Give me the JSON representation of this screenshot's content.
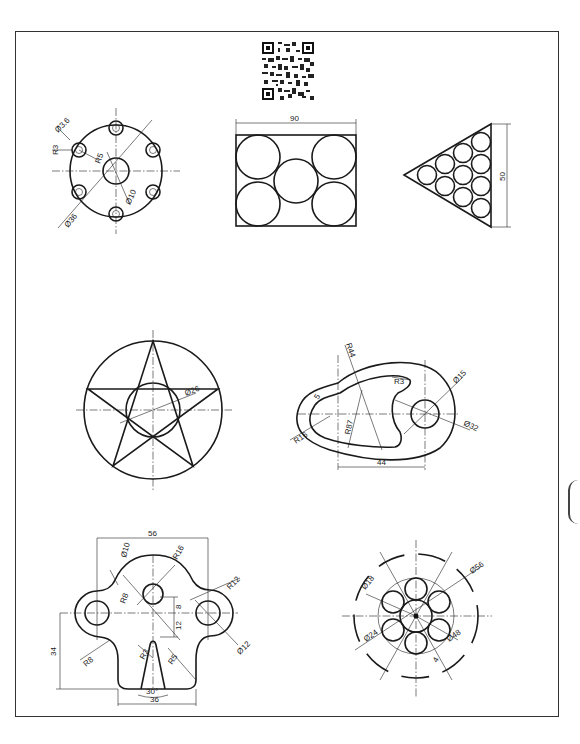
{
  "sheet": {
    "qr_code": "qr-code-icon",
    "figures": {
      "flange": {
        "labels": {
          "hole_dia": "Ø3.6",
          "boss_r": "R3",
          "pitch_r": "R5",
          "center_dia": "Ø10",
          "pcd": "Ø36"
        }
      },
      "rect_circles": {
        "labels": {
          "width": "90"
        }
      },
      "triangle_circles": {
        "labels": {
          "height": "50"
        }
      },
      "star": {
        "labels": {
          "inner_dia": "Ø26"
        }
      },
      "cam": {
        "labels": {
          "outer_r": "R44",
          "inner_r": "R87",
          "slot_r": "R3",
          "offset": "5",
          "left_r": "R16",
          "hole_dia": "Ø15",
          "boss_dia": "Ø32",
          "distance": "44"
        }
      },
      "bracket": {
        "labels": {
          "width": "56",
          "top_hole": "Ø10",
          "top_r": "R16",
          "neck_r": "R8",
          "right_r": "R12",
          "right_hole": "Ø12",
          "offset_8": "8",
          "offset_12": "12",
          "height": "34",
          "left_r": "R8",
          "slot_r": "R3",
          "slot_side_r": "R5",
          "angle": "30°",
          "base": "36"
        }
      },
      "fan_wheel": {
        "labels": {
          "outer_dia": "Ø56",
          "slot_dia": "Ø18",
          "hub_dia": "Ø24",
          "pitch_dia": "Ø48",
          "slot_w": "4"
        }
      }
    }
  }
}
